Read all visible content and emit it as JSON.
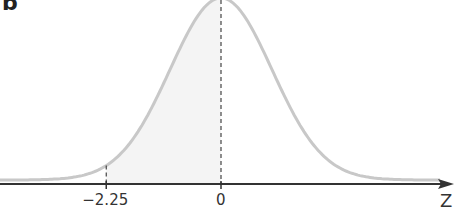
{
  "panel_label": "b",
  "chart_data": {
    "type": "line",
    "title": "",
    "distribution": "standard normal",
    "mean": 0,
    "sd": 1,
    "xlabel": "Z",
    "ylabel": "",
    "x_ticks": [
      {
        "value": -2.25,
        "label": "−2.25"
      },
      {
        "value": 0,
        "label": "0"
      }
    ],
    "shaded_region": {
      "from": -2.25,
      "to": 0
    },
    "reference_lines": [
      {
        "x": -2.25,
        "style": "dashed"
      },
      {
        "x": 0,
        "style": "dashed"
      }
    ],
    "xlim": [
      -4.3,
      4.5
    ],
    "grid": false,
    "legend": null
  },
  "colors": {
    "curve": "#c8c8c8",
    "axis": "#333333",
    "shade": "#f4f4f4",
    "dashed": "#444444"
  }
}
